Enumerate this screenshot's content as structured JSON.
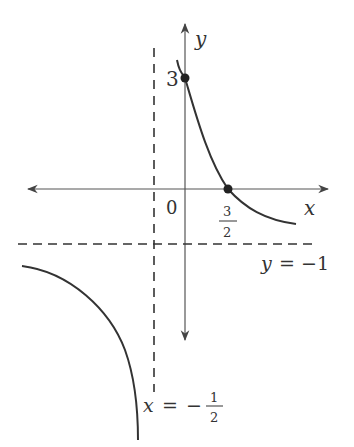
{
  "diagram": {
    "type": "rational-function-graph",
    "axes": {
      "x_label": "x",
      "y_label": "y",
      "origin_label": "0"
    },
    "asymptotes": {
      "horizontal": {
        "eq_lhs": "y",
        "eq_sign": "=",
        "eq_rhs": "−1",
        "value": -1
      },
      "vertical": {
        "eq_lhs": "x",
        "eq_sign": "=",
        "eq_rhs_sign": "−",
        "eq_rhs_num": "1",
        "eq_rhs_den": "2",
        "value": -0.5
      }
    },
    "points": [
      {
        "name": "y-intercept",
        "label": "3",
        "x": 0,
        "y": 3
      },
      {
        "name": "x-intercept",
        "label_num": "3",
        "label_den": "2",
        "x": 1.5,
        "y": 0
      }
    ],
    "colors": {
      "curve": "#333333",
      "axis": "#444444",
      "asymptote": "#333333"
    }
  }
}
